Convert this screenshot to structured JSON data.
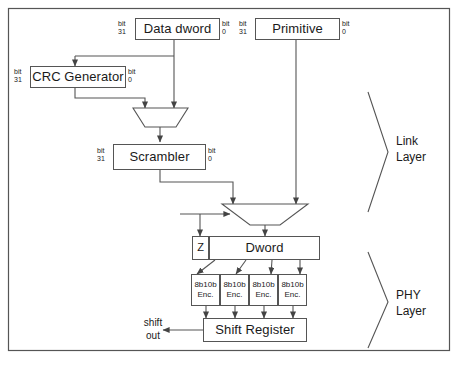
{
  "diagram": {
    "title_text": "",
    "frame": {
      "x": 8,
      "y": 8,
      "w": 442,
      "h": 343
    },
    "stroke_color": "#555555",
    "text_color": "#1a1a1a"
  },
  "blocks": {
    "data_dword": {
      "label": "Data dword",
      "bit_high": "bit",
      "bit_high_num": "31",
      "bit_low": "bit",
      "bit_low_num": "0"
    },
    "primitive": {
      "label": "Primitive",
      "bit_high": "bit",
      "bit_high_num": "31",
      "bit_low": "bit",
      "bit_low_num": "0"
    },
    "crc_generator": {
      "label": "CRC Generator",
      "bit_high": "bit",
      "bit_high_num": "31",
      "bit_low": "bit",
      "bit_low_num": "0"
    },
    "scrambler": {
      "label": "Scrambler",
      "bit_high": "bit",
      "bit_high_num": "31",
      "bit_low": "bit",
      "bit_low_num": "0"
    },
    "z_box": {
      "label": "Z"
    },
    "dword": {
      "label": "Dword"
    },
    "shift_register": {
      "label": "Shift Register"
    }
  },
  "encoders": [
    {
      "line1": "8b10b",
      "line2": "Enc."
    },
    {
      "line1": "8b10b",
      "line2": "Enc."
    },
    {
      "line1": "8b10b",
      "line2": "Enc."
    },
    {
      "line1": "8b10b",
      "line2": "Enc."
    }
  ],
  "labels": {
    "shift_out_line1": "shift",
    "shift_out_line2": "out",
    "link_layer_line1": "Link",
    "link_layer_line2": "Layer",
    "phy_layer_line1": "PHY",
    "phy_layer_line2": "Layer"
  },
  "multiplexers": [
    {
      "name": "mux-scrambler-input"
    },
    {
      "name": "mux-dword-input"
    }
  ]
}
